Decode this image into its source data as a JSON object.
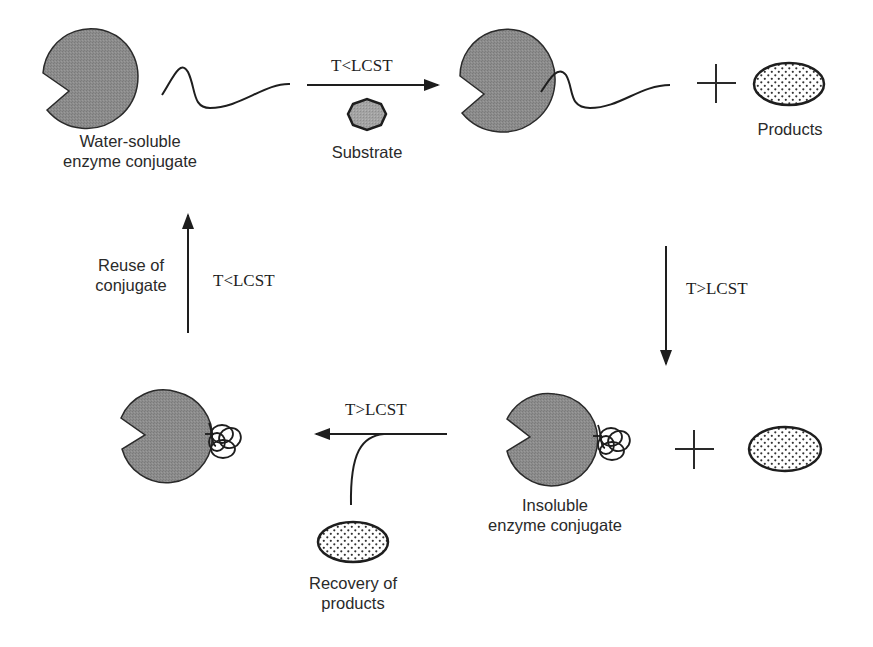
{
  "diagram": {
    "type": "cycle",
    "colors": {
      "enzyme_fill": "#8a8a8a",
      "outline": "#2a2a2a",
      "substrate_fill": "#9a9a9a",
      "product_dot": "#333333",
      "background": "#ffffff"
    },
    "top_left": {
      "label_line1": "Water-soluble",
      "label_line2": "enzyme conjugate"
    },
    "top_arrow": {
      "condition": "T<LCST",
      "reagent_label": "Substrate"
    },
    "top_right": {
      "plus": "+",
      "product_label": "Products"
    },
    "right_arrow": {
      "condition": "T>LCST"
    },
    "bottom_right": {
      "label_line1": "Insoluble",
      "label_line2": "enzyme conjugate",
      "plus": "+"
    },
    "bottom_arrow": {
      "condition": "T>LCST",
      "side_label_line1": "Recovery of",
      "side_label_line2": "products"
    },
    "left_arrow": {
      "condition": "T<LCST",
      "side_label_line1": "Reuse of",
      "side_label_line2": "conjugate"
    }
  }
}
